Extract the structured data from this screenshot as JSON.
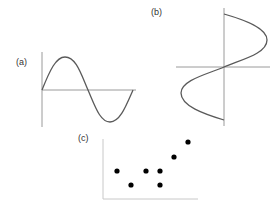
{
  "figure": {
    "panels": [
      {
        "id": "a",
        "label": "(a)",
        "description": "Sine wave y = sin(x) over one full period on x/y axes",
        "curve": "sine",
        "colors": {
          "axis": "#9a9a9a",
          "curve": "#5a5a5a"
        }
      },
      {
        "id": "b",
        "label": "(b)",
        "description": "Sine wave rotated: x = sin(y), curve swings right above the horizontal axis and left below it",
        "curve": "rotated-sine",
        "colors": {
          "axis": "#9a9a9a",
          "curve": "#5a5a5a"
        }
      },
      {
        "id": "c",
        "label": "(c)",
        "description": "Scatter of 7 black points trending upward to the right",
        "curve": "scatter",
        "points_px": [
          [
            117,
            171
          ],
          [
            131,
            185
          ],
          [
            146,
            171
          ],
          [
            160,
            171
          ],
          [
            160,
            185
          ],
          [
            174,
            157
          ],
          [
            188,
            142
          ]
        ],
        "colors": {
          "axis": "#c8c8c8",
          "point": "#000000"
        }
      }
    ]
  }
}
